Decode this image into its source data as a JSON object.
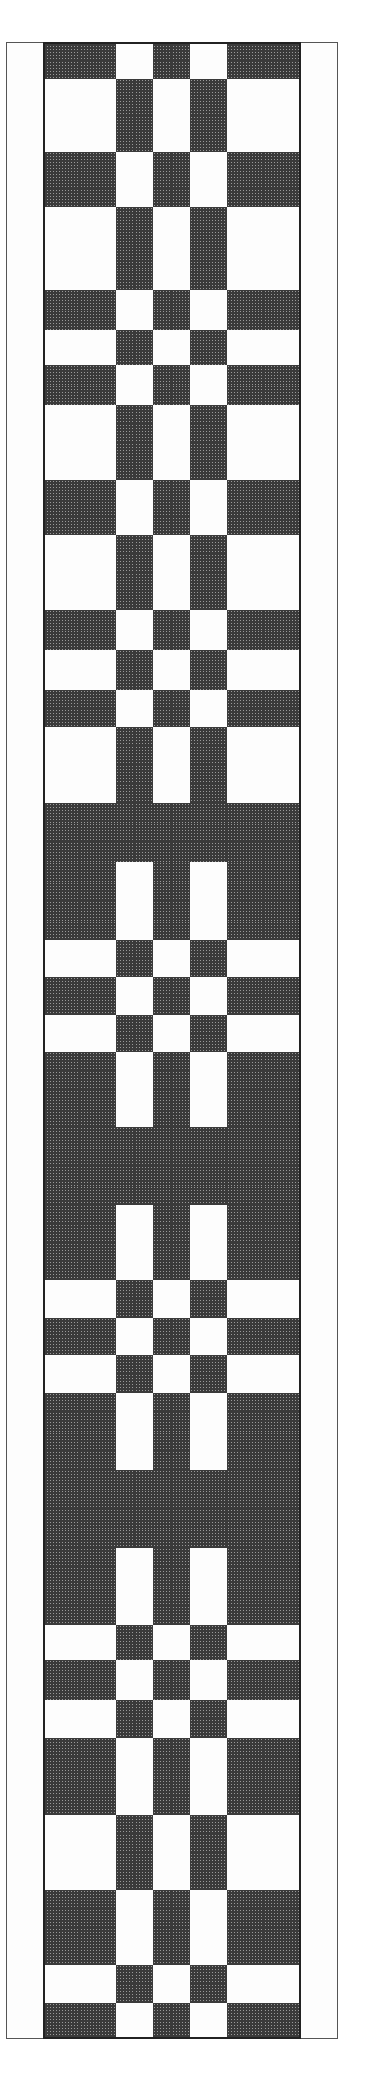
{
  "chart": {
    "title": "",
    "grid": {
      "columns": 18,
      "left": 6,
      "top": 42,
      "cell_width": 18.4,
      "border_columns_left": 2,
      "border_columns_right": 2
    },
    "colors": {
      "dark": "#3a3a3a",
      "light": "#fdfdfd",
      "gridline": "#555555"
    },
    "row_types": {
      "X": "WWDDDDWWDDWWDDDDWW",
      "Y": "WWWWWWDDWWDDWWWWWW",
      "Z": "WWDDDDDDDDDDDDDDWW"
    },
    "segments": [
      {
        "type": "X",
        "y0": 42,
        "y1": 79,
        "rows": 2
      },
      {
        "type": "Y",
        "y0": 79,
        "y1": 152,
        "rows": 4
      },
      {
        "type": "X",
        "y0": 152,
        "y1": 207,
        "rows": 3
      },
      {
        "type": "Y",
        "y0": 207,
        "y1": 290,
        "rows": 4
      },
      {
        "type": "X",
        "y0": 290,
        "y1": 330,
        "rows": 2
      },
      {
        "type": "Y",
        "y0": 330,
        "y1": 365,
        "rows": 2
      },
      {
        "type": "X",
        "y0": 365,
        "y1": 405,
        "rows": 2
      },
      {
        "type": "Y",
        "y0": 405,
        "y1": 480,
        "rows": 4
      },
      {
        "type": "X",
        "y0": 480,
        "y1": 535,
        "rows": 3
      },
      {
        "type": "Y",
        "y0": 535,
        "y1": 610,
        "rows": 4
      },
      {
        "type": "X",
        "y0": 610,
        "y1": 650,
        "rows": 2
      },
      {
        "type": "Y",
        "y0": 650,
        "y1": 690,
        "rows": 2
      },
      {
        "type": "X",
        "y0": 690,
        "y1": 727,
        "rows": 2
      },
      {
        "type": "Y",
        "y0": 727,
        "y1": 803,
        "rows": 4
      },
      {
        "type": "Z",
        "y0": 803,
        "y1": 862,
        "rows": 3
      },
      {
        "type": "X",
        "y0": 862,
        "y1": 940,
        "rows": 4
      },
      {
        "type": "Y",
        "y0": 940,
        "y1": 977,
        "rows": 2
      },
      {
        "type": "X",
        "y0": 977,
        "y1": 1015,
        "rows": 2
      },
      {
        "type": "Y",
        "y0": 1015,
        "y1": 1052,
        "rows": 2
      },
      {
        "type": "X",
        "y0": 1052,
        "y1": 1127,
        "rows": 4
      },
      {
        "type": "Z",
        "y0": 1127,
        "y1": 1205,
        "rows": 4
      },
      {
        "type": "X",
        "y0": 1205,
        "y1": 1280,
        "rows": 4
      },
      {
        "type": "Y",
        "y0": 1280,
        "y1": 1318,
        "rows": 2
      },
      {
        "type": "X",
        "y0": 1318,
        "y1": 1355,
        "rows": 2
      },
      {
        "type": "Y",
        "y0": 1355,
        "y1": 1393,
        "rows": 2
      },
      {
        "type": "X",
        "y0": 1393,
        "y1": 1470,
        "rows": 4
      },
      {
        "type": "Z",
        "y0": 1470,
        "y1": 1548,
        "rows": 4
      },
      {
        "type": "X",
        "y0": 1548,
        "y1": 1625,
        "rows": 4
      },
      {
        "type": "Y",
        "y0": 1625,
        "y1": 1660,
        "rows": 2
      },
      {
        "type": "X",
        "y0": 1660,
        "y1": 1700,
        "rows": 2
      },
      {
        "type": "Y",
        "y0": 1700,
        "y1": 1738,
        "rows": 2
      },
      {
        "type": "X",
        "y0": 1738,
        "y1": 1815,
        "rows": 4
      },
      {
        "type": "Y",
        "y0": 1815,
        "y1": 1890,
        "rows": 4
      },
      {
        "type": "X",
        "y0": 1890,
        "y1": 1965,
        "rows": 4
      },
      {
        "type": "Y",
        "y0": 1965,
        "y1": 2003,
        "rows": 2
      },
      {
        "type": "X",
        "y0": 2003,
        "y1": 2038,
        "rows": 2
      }
    ]
  }
}
